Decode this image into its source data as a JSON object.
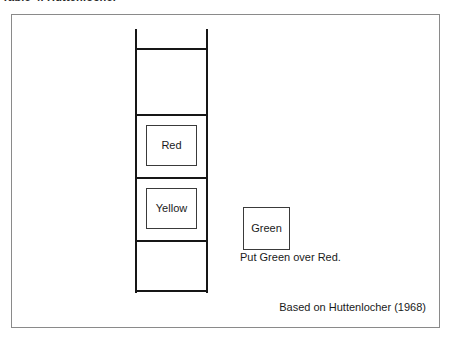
{
  "figure": {
    "top_caption": "Table 4.  Huttenlocher",
    "instruction": "Put Green over Red.",
    "attribution": "Based on Huttenlocher (1968)",
    "border_color": "#8a8a8a",
    "ink_color": "#161616",
    "background_color": "#ffffff"
  },
  "ladder": {
    "name": "ladder",
    "rail_count": 2,
    "rung_count": 5,
    "cells": [
      {
        "index": 0,
        "label": "",
        "has_box": false
      },
      {
        "index": 1,
        "label": "Red",
        "has_box": true
      },
      {
        "index": 2,
        "label": "Yellow",
        "has_box": true
      },
      {
        "index": 3,
        "label": "",
        "has_box": false
      }
    ]
  },
  "loose_object": {
    "label": "Green",
    "name": "green-box"
  }
}
